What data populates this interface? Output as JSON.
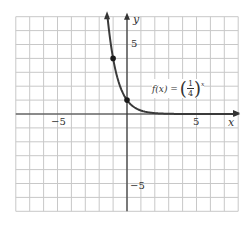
{
  "chart_data": {
    "type": "line",
    "title": "",
    "function_label": "f(x) = (1/4)^x",
    "xlabel": "x",
    "ylabel": "y",
    "xlim": [
      -8,
      8
    ],
    "ylim": [
      -7,
      7
    ],
    "grid": true,
    "x_tick_labels": [
      {
        "value": -5,
        "label": "−5"
      },
      {
        "value": 5,
        "label": "5"
      }
    ],
    "y_tick_labels": [
      {
        "value": 5,
        "label": "5"
      },
      {
        "value": -5,
        "label": "−5"
      }
    ],
    "series": [
      {
        "name": "f(x) = (1/4)^x",
        "x": [
          -1.4,
          -1.2,
          -1,
          -0.75,
          -0.5,
          -0.25,
          0,
          0.5,
          1,
          2,
          3,
          4,
          5,
          6,
          7,
          8
        ],
        "values": [
          6.96,
          5.28,
          4,
          2.83,
          2,
          1.41,
          1,
          0.5,
          0.25,
          0.0625,
          0.0156,
          0.0039,
          0.001,
          0.0002,
          0.0001,
          0
        ]
      }
    ],
    "highlighted_points": [
      {
        "x": -1,
        "y": 4
      },
      {
        "x": 0,
        "y": 1
      }
    ],
    "colors": {
      "grid": "#c8c8c8",
      "axis": "#333333",
      "curve": "#3a3a3a",
      "background": "#ffffff"
    }
  },
  "labels": {
    "x_axis": "x",
    "y_axis": "y",
    "x_neg5": "−5",
    "x_pos5": "5",
    "y_pos5": "5",
    "y_neg5": "−5",
    "func_prefix": "f(x) =",
    "func_num": "1",
    "func_den": "4",
    "func_exp": "x"
  }
}
